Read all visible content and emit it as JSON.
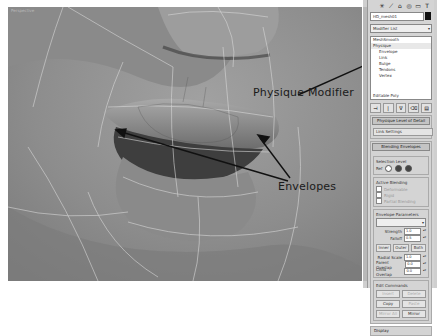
{
  "viewport": {
    "label": "Perspective",
    "background": "#8e8e8e",
    "wire_color": "#d8d8d8",
    "subject": "3D head model — nose, upper and lower lips with envelope wireframe"
  },
  "callouts": {
    "physique": "Physique Modifier",
    "envelopes": "Envelopes"
  },
  "command_panel": {
    "tab_icons": [
      "create-icon",
      "modify-icon",
      "hierarchy-icon",
      "motion-icon",
      "display-icon",
      "utilities-icon"
    ],
    "tab_glyphs": [
      "✳",
      "⟋",
      "⌂",
      "◎",
      "▭",
      "T"
    ],
    "object_name": "HD_mesh01",
    "modifier_list": "Modifier List",
    "stack": [
      {
        "label": "MeshSmooth",
        "level": 0
      },
      {
        "label": "Physique",
        "level": 0,
        "selected": true
      },
      {
        "label": "Envelope",
        "level": 1
      },
      {
        "label": "Link",
        "level": 1
      },
      {
        "label": "Bulge",
        "level": 1
      },
      {
        "label": "Tendons",
        "level": 1
      },
      {
        "label": "Vertex",
        "level": 1
      },
      {
        "label": "Editable Poly",
        "level": 0
      }
    ],
    "stack_tools": [
      "⊣",
      "|",
      "∇",
      "⌫",
      "▤"
    ],
    "rollouts": {
      "level_of_detail": {
        "title": "Physique Level of Detail",
        "field": "Link Settings"
      },
      "blending_envelopes": {
        "title": "Blending Envelopes",
        "selection_level_label": "Selection Level",
        "selection_level_prefix": "Ref",
        "active_blending_label": "Active Blending",
        "checks": [
          "Deformable",
          "Rigid",
          "Partial Blending"
        ],
        "envelope_parameters_label": "Envelope Parameters",
        "strength_label": "Strength",
        "strength_value": "1.0",
        "falloff_label": "Falloff",
        "falloff_value": "0.5",
        "buttons_row1": [
          "Inner",
          "Outer",
          "Both"
        ],
        "radial_scale_label": "Radial Scale",
        "radial_scale_value": "1.0",
        "parent_overlap_label": "Parent Overlap",
        "parent_overlap_value": "0.0",
        "child_overlap_label": "Child Overlap",
        "child_overlap_value": "0.0",
        "edit_commands_label": "Edit Commands",
        "edit_buttons": [
          {
            "label": "Insert",
            "enabled": false
          },
          {
            "label": "Delete",
            "enabled": false
          },
          {
            "label": "Copy",
            "enabled": true
          },
          {
            "label": "Paste",
            "enabled": false
          },
          {
            "label": "Mirror All",
            "enabled": false
          },
          {
            "label": "Mirror",
            "enabled": true
          }
        ]
      },
      "display": {
        "title": "Display"
      }
    }
  }
}
